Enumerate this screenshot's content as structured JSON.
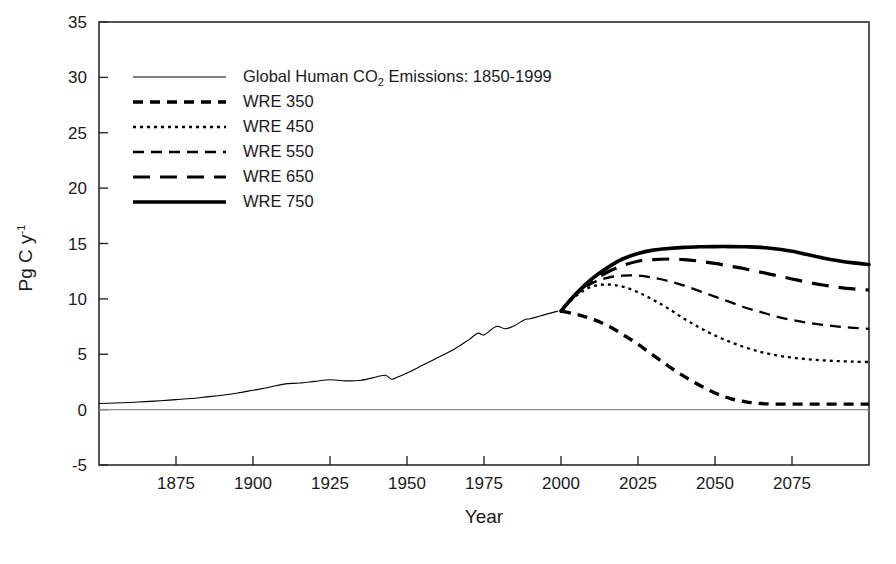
{
  "chart_data": {
    "type": "line",
    "title": "",
    "xlabel": "Year",
    "ylabel": "Pg C y-1",
    "ylabel_base": "Pg C y",
    "ylabel_exponent": "-1",
    "xlim": [
      1850,
      2100
    ],
    "ylim": [
      -5,
      35
    ],
    "xticks": [
      1875,
      1900,
      1925,
      1950,
      1975,
      2000,
      2025,
      2050,
      2075
    ],
    "yticks": [
      -5,
      0,
      5,
      10,
      15,
      20,
      25,
      30,
      35
    ],
    "grid": false,
    "zero_line": true,
    "legend_position": "upper-left-inside",
    "series": [
      {
        "name": "Global Human CO2 Emissions: 1850-1999",
        "legend_label_pre": "Global Human CO",
        "legend_label_sub": "2",
        "legend_label_post": " Emissions: 1850-1999",
        "style": "solid-thin",
        "linewidth": 1.1,
        "dash": "none",
        "color": "#000000",
        "x": [
          1850,
          1855,
          1860,
          1865,
          1870,
          1875,
          1880,
          1885,
          1890,
          1895,
          1900,
          1905,
          1910,
          1915,
          1920,
          1925,
          1930,
          1935,
          1940,
          1943,
          1945,
          1947,
          1950,
          1955,
          1960,
          1965,
          1970,
          1973,
          1975,
          1979,
          1982,
          1985,
          1988,
          1990,
          1992,
          1995,
          1999
        ],
        "y": [
          0.55,
          0.6,
          0.65,
          0.72,
          0.8,
          0.9,
          1.0,
          1.15,
          1.3,
          1.5,
          1.75,
          2.0,
          2.3,
          2.4,
          2.55,
          2.7,
          2.6,
          2.65,
          2.95,
          3.1,
          2.75,
          2.95,
          3.3,
          4.0,
          4.7,
          5.4,
          6.3,
          6.9,
          6.75,
          7.5,
          7.3,
          7.6,
          8.1,
          8.2,
          8.35,
          8.6,
          8.9
        ]
      },
      {
        "name": "WRE 350",
        "legend_label_pre": "WRE 350",
        "style": "dashed-thick-short",
        "linewidth": 3.4,
        "dash": "10,7",
        "color": "#000000",
        "x": [
          2000,
          2005,
          2010,
          2015,
          2020,
          2025,
          2030,
          2035,
          2040,
          2045,
          2050,
          2055,
          2060,
          2065,
          2070,
          2075,
          2080,
          2085,
          2090,
          2095,
          2100
        ],
        "y": [
          8.9,
          8.6,
          8.2,
          7.6,
          6.8,
          5.9,
          4.9,
          3.9,
          3.0,
          2.2,
          1.5,
          1.0,
          0.7,
          0.55,
          0.5,
          0.5,
          0.5,
          0.5,
          0.5,
          0.5,
          0.5
        ]
      },
      {
        "name": "WRE 450",
        "legend_label_pre": "WRE 450",
        "style": "dotted-thin",
        "linewidth": 2.3,
        "dash": "3,4",
        "color": "#000000",
        "x": [
          2000,
          2005,
          2010,
          2015,
          2020,
          2025,
          2030,
          2035,
          2040,
          2045,
          2050,
          2055,
          2060,
          2065,
          2070,
          2075,
          2080,
          2085,
          2090,
          2095,
          2100
        ],
        "y": [
          8.9,
          10.3,
          11.1,
          11.3,
          11.1,
          10.6,
          9.9,
          9.1,
          8.2,
          7.4,
          6.7,
          6.1,
          5.6,
          5.2,
          4.9,
          4.7,
          4.55,
          4.45,
          4.38,
          4.33,
          4.3
        ]
      },
      {
        "name": "WRE 550",
        "legend_label_pre": "WRE 550",
        "style": "dashed-thin-medium",
        "linewidth": 2.3,
        "dash": "11,7",
        "color": "#000000",
        "x": [
          2000,
          2005,
          2010,
          2015,
          2020,
          2025,
          2030,
          2035,
          2040,
          2045,
          2050,
          2055,
          2060,
          2065,
          2070,
          2075,
          2080,
          2085,
          2090,
          2095,
          2100
        ],
        "y": [
          8.9,
          10.4,
          11.4,
          11.9,
          12.1,
          12.1,
          11.9,
          11.6,
          11.2,
          10.7,
          10.2,
          9.7,
          9.2,
          8.8,
          8.4,
          8.1,
          7.85,
          7.65,
          7.5,
          7.38,
          7.3
        ]
      },
      {
        "name": "WRE 650",
        "legend_label_pre": "WRE 650",
        "style": "dashed-thick-long",
        "linewidth": 3.2,
        "dash": "17,10",
        "color": "#000000",
        "x": [
          2000,
          2005,
          2010,
          2015,
          2020,
          2025,
          2030,
          2035,
          2040,
          2045,
          2050,
          2055,
          2060,
          2065,
          2070,
          2075,
          2080,
          2085,
          2090,
          2095,
          2100
        ],
        "y": [
          8.9,
          10.5,
          11.6,
          12.4,
          13.0,
          13.4,
          13.55,
          13.6,
          13.55,
          13.4,
          13.2,
          12.95,
          12.7,
          12.4,
          12.1,
          11.8,
          11.5,
          11.25,
          11.05,
          10.9,
          10.8
        ]
      },
      {
        "name": "WRE 750",
        "legend_label_pre": "WRE 750",
        "style": "solid-thick",
        "linewidth": 3.6,
        "dash": "none",
        "color": "#000000",
        "x": [
          2000,
          2005,
          2010,
          2015,
          2020,
          2025,
          2030,
          2035,
          2040,
          2045,
          2050,
          2055,
          2060,
          2065,
          2070,
          2075,
          2080,
          2085,
          2090,
          2095,
          2100
        ],
        "y": [
          8.9,
          10.5,
          11.8,
          12.8,
          13.6,
          14.1,
          14.4,
          14.55,
          14.65,
          14.7,
          14.72,
          14.72,
          14.7,
          14.65,
          14.5,
          14.3,
          14.0,
          13.7,
          13.45,
          13.25,
          13.1
        ]
      }
    ]
  },
  "axes": {
    "x_title": "Year",
    "y_title_base": "Pg C y",
    "y_title_exp": "-1",
    "xtick_labels": [
      "1875",
      "1900",
      "1925",
      "1950",
      "1975",
      "2000",
      "2025",
      "2050",
      "2075"
    ],
    "ytick_labels": [
      "35",
      "30",
      "25",
      "20",
      "15",
      "10",
      "5",
      "0",
      "-5"
    ]
  },
  "legend": {
    "entries": [
      {
        "label_pre": "Global Human CO",
        "label_sub": "2",
        "label_post": " Emissions: 1850-1999",
        "style": "solid-thin"
      },
      {
        "label_pre": "WRE 350",
        "label_sub": "",
        "label_post": "",
        "style": "dashed-thick-short"
      },
      {
        "label_pre": "WRE 450",
        "label_sub": "",
        "label_post": "",
        "style": "dotted-thin"
      },
      {
        "label_pre": "WRE 550",
        "label_sub": "",
        "label_post": "",
        "style": "dashed-thin-medium"
      },
      {
        "label_pre": "WRE 650",
        "label_sub": "",
        "label_post": "",
        "style": "dashed-thick-long"
      },
      {
        "label_pre": "WRE 750",
        "label_sub": "",
        "label_post": "",
        "style": "solid-thick"
      }
    ]
  },
  "colors": {
    "line": "#000000",
    "frame": "#2b2b2b",
    "background": "#ffffff",
    "zero_line": "#8a8a8a"
  }
}
